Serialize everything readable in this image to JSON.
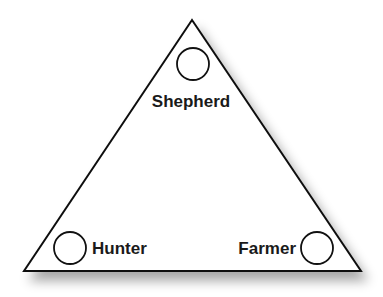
{
  "diagram": {
    "type": "triangle",
    "colors": {
      "stroke": "#111111",
      "fill": "#ffffff",
      "text": "#1a1a1a",
      "shadow": "#9a9a9a"
    },
    "vertices": {
      "top": {
        "label": "Shepherd"
      },
      "bottom_left": {
        "label": "Hunter"
      },
      "bottom_right": {
        "label": "Farmer"
      }
    }
  }
}
